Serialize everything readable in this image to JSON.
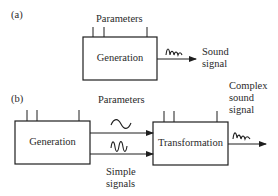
{
  "panel_a": {
    "tag": "(a)",
    "parameters_label": "Parameters",
    "generation_box": "Generation",
    "output_label_line1": "Sound",
    "output_label_line2": "signal"
  },
  "panel_b": {
    "tag": "(b)",
    "parameters_label": "Parameters",
    "generation_box": "Generation",
    "transformation_box": "Transformation",
    "simple_signals_line1": "Simple",
    "simple_signals_line2": "signals",
    "output_label_line1": "Complex",
    "output_label_line2": "sound",
    "output_label_line3": "signal"
  },
  "colors": {
    "stroke": "#1e1e1e",
    "background": "#ffffff"
  }
}
